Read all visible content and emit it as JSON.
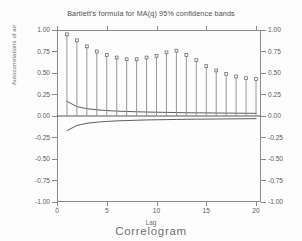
{
  "chart_data": {
    "type": "bar",
    "title": "Bartlett's formula for MA(q) 95% confidence bands",
    "caption": "Correlogram",
    "xlabel": "Lag",
    "ylabel": "Autocorrelations of air",
    "xlim": [
      0,
      20.5
    ],
    "ylim": [
      -1.0,
      1.0
    ],
    "xticks": [
      0,
      5,
      10,
      15,
      20
    ],
    "xtick_labels": [
      "0",
      "5",
      "10",
      "15",
      "20"
    ],
    "yticks": [
      1.0,
      0.75,
      0.5,
      0.25,
      0.0,
      -0.25,
      -0.5,
      -0.75,
      -1.0
    ],
    "ytick_labels": [
      "1.00",
      "0.75",
      "0.50",
      "0.25",
      "0.00",
      "-0.25",
      "-0.50",
      "-0.75",
      "-1.00"
    ],
    "grid": false,
    "legend": "none",
    "series": [
      {
        "name": "Autocorrelations of air",
        "style": "spike-with-marker",
        "x": [
          1,
          2,
          3,
          4,
          5,
          6,
          7,
          8,
          9,
          10,
          11,
          12,
          13,
          14,
          15,
          16,
          17,
          18,
          19,
          20
        ],
        "values": [
          0.95,
          0.88,
          0.81,
          0.75,
          0.71,
          0.68,
          0.66,
          0.66,
          0.68,
          0.7,
          0.74,
          0.76,
          0.71,
          0.65,
          0.58,
          0.53,
          0.49,
          0.46,
          0.44,
          0.43
        ]
      },
      {
        "name": "Bartlett upper 95% confidence band",
        "style": "line",
        "x": [
          1,
          2,
          3,
          4,
          5,
          6,
          7,
          8,
          9,
          10,
          11,
          12,
          13,
          14,
          15,
          16,
          17,
          18,
          19,
          20
        ],
        "values": [
          0.17,
          0.11,
          0.085,
          0.072,
          0.063,
          0.057,
          0.053,
          0.049,
          0.046,
          0.044,
          0.042,
          0.04,
          0.038,
          0.037,
          0.036,
          0.035,
          0.034,
          0.033,
          0.032,
          0.031
        ]
      },
      {
        "name": "Bartlett lower 95% confidence band",
        "style": "line",
        "x": [
          1,
          2,
          3,
          4,
          5,
          6,
          7,
          8,
          9,
          10,
          11,
          12,
          13,
          14,
          15,
          16,
          17,
          18,
          19,
          20
        ],
        "values": [
          -0.17,
          -0.11,
          -0.085,
          -0.072,
          -0.063,
          -0.057,
          -0.053,
          -0.049,
          -0.046,
          -0.044,
          -0.042,
          -0.04,
          -0.038,
          -0.037,
          -0.036,
          -0.035,
          -0.034,
          -0.033,
          -0.032,
          -0.031
        ]
      },
      {
        "name": "zero reference line",
        "style": "hline",
        "value": 0.0
      }
    ],
    "colors": {
      "spike": "#8a8a8a",
      "marker": "#6e6e6e",
      "band": "#4a4a4a",
      "zero_line": "#555555",
      "frame": "#8a8a8a",
      "text": "#555555",
      "background": "#fdfdfd"
    }
  }
}
